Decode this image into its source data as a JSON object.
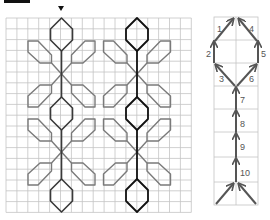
{
  "figure": {
    "colors": {
      "grid": "#c4c4c4",
      "motif_primary": "#3a3a3a",
      "motif_highlight": "#111111",
      "petal": "#7a7a7a",
      "arrow": "#555555",
      "header_bar": "#111111"
    },
    "start_marker": "triangle-down",
    "grid": {
      "x0": 6,
      "y0": 18,
      "cols": 17,
      "rows": 18,
      "cell_w": 10.9,
      "cell_h": 10.8
    },
    "motif_axes": [
      61.5,
      137
    ]
  },
  "stitch_guide": {
    "steps": [
      {
        "n": "1",
        "dir": "diag-up-right"
      },
      {
        "n": "2",
        "dir": "up"
      },
      {
        "n": "3",
        "dir": "diag-up-left"
      },
      {
        "n": "4",
        "dir": "diag-up-left"
      },
      {
        "n": "5",
        "dir": "up"
      },
      {
        "n": "6",
        "dir": "diag-up-right"
      },
      {
        "n": "7",
        "dir": "up"
      },
      {
        "n": "8",
        "dir": "up"
      },
      {
        "n": "9",
        "dir": "up"
      },
      {
        "n": "10",
        "dir": "up"
      }
    ]
  }
}
